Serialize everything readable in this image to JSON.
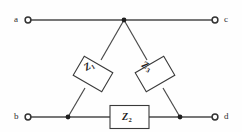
{
  "figure": {
    "type": "electrical-circuit-diagram",
    "background_color": "#fefefe",
    "line_color": "#3a3a3a",
    "text_color": "#1c1c1c"
  },
  "terminals": [
    {
      "id": "a",
      "label": "a",
      "position": "top-left",
      "x": 28,
      "y": 20
    },
    {
      "id": "c",
      "label": "c",
      "position": "top-right",
      "x": 215,
      "y": 20
    },
    {
      "id": "b",
      "label": "b",
      "position": "bottom-left",
      "x": 28,
      "y": 117
    },
    {
      "id": "d",
      "label": "d",
      "position": "bottom-right",
      "x": 215,
      "y": 117
    }
  ],
  "nodes": [
    {
      "id": "apex",
      "x": 124,
      "y": 20,
      "junction": true
    },
    {
      "id": "bottom-left",
      "x": 68,
      "y": 117,
      "junction": true
    },
    {
      "id": "bottom-right",
      "x": 180,
      "y": 117,
      "junction": true
    }
  ],
  "components": [
    {
      "id": "z1",
      "label": "Z",
      "subscript": "1",
      "orientation": "diagonal",
      "angle_deg": -31,
      "between": [
        "apex",
        "bottom-left"
      ]
    },
    {
      "id": "z2",
      "label": "Z",
      "subscript": "2",
      "orientation": "horizontal",
      "angle_deg": 0,
      "between": [
        "bottom-left",
        "bottom-right"
      ]
    },
    {
      "id": "z3",
      "label": "Z",
      "subscript": "3",
      "orientation": "diagonal",
      "angle_deg": 31,
      "between": [
        "apex",
        "bottom-right"
      ]
    }
  ],
  "wires": [
    {
      "id": "top-wire",
      "from": "a",
      "to": "c",
      "y": 20
    },
    {
      "id": "bottom-wire",
      "from": "b",
      "to": "d",
      "y": 117
    },
    {
      "id": "left-diagonal",
      "from": "apex",
      "to": "bottom-left"
    },
    {
      "id": "right-diagonal",
      "from": "apex",
      "to": "bottom-right"
    }
  ]
}
